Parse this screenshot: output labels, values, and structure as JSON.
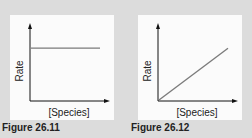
{
  "chart_data": [
    {
      "type": "line",
      "title": "",
      "caption": "Figure 26.11",
      "xlabel": "[Species]",
      "ylabel": "Rate",
      "xlim": [
        0,
        1
      ],
      "ylim": [
        0,
        1
      ],
      "grid": false,
      "series": [
        {
          "name": "rate",
          "color": "#7a7a7a",
          "x": [
            0,
            1
          ],
          "y": [
            0.73,
            0.73
          ]
        }
      ]
    },
    {
      "type": "line",
      "title": "",
      "caption": "Figure 26.12",
      "xlabel": "[Species]",
      "ylabel": "Rate",
      "xlim": [
        0,
        1
      ],
      "ylim": [
        0,
        1
      ],
      "grid": false,
      "series": [
        {
          "name": "rate",
          "color": "#7a7a7a",
          "x": [
            0,
            1
          ],
          "y": [
            0,
            0.73
          ]
        }
      ]
    }
  ]
}
